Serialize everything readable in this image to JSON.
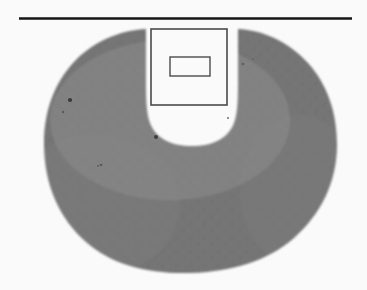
{
  "figure": {
    "kind": "scanned-grayscale-figure",
    "canvas": {
      "width": 367,
      "height": 290
    },
    "background_color": "#fbfafa",
    "caption": "",
    "title": "",
    "labels": [],
    "annotations": []
  },
  "rule": {
    "name": "top-horizontal-rule",
    "x1": 19,
    "y1": 18.5,
    "x2": 352,
    "y2": 18.5,
    "thickness": 2.4,
    "color": "#141414"
  },
  "specimen": {
    "name": "crescent-specimen-region",
    "description": "C-shaped / horseshoe grey halftone region with a rounded U notch opening upward at top centre",
    "fill_color": "#a9a9a9",
    "edge_color": "#8f8f8f",
    "bounds": {
      "left": 44,
      "top": 29,
      "right": 337,
      "bottom": 273
    },
    "notch": {
      "name": "u-notch",
      "left": 146,
      "right": 238,
      "top": 29,
      "bottom": 146,
      "fill_color": "#fbfafa"
    }
  },
  "roi_box": {
    "name": "roi-square",
    "x": 151,
    "y": 29,
    "width": 76,
    "height": 76,
    "stroke_color": "#4a4a4a",
    "stroke_width": 1.6,
    "fill": "none"
  },
  "inner_box": {
    "name": "roi-inner-rectangle",
    "x": 170,
    "y": 57,
    "width": 40,
    "height": 19,
    "stroke_color": "#4a4a4a",
    "stroke_width": 1.4,
    "fill": "none"
  },
  "specks": [
    {
      "name": "scan-speck",
      "cx": 70,
      "cy": 100,
      "r": 2.1,
      "color": "#3a3a3a"
    },
    {
      "name": "scan-speck",
      "cx": 63,
      "cy": 112,
      "r": 1.2,
      "color": "#5c5c5c"
    },
    {
      "name": "scan-speck",
      "cx": 156,
      "cy": 137,
      "r": 2.0,
      "color": "#3f3f3f"
    },
    {
      "name": "scan-speck",
      "cx": 101,
      "cy": 165,
      "r": 1.3,
      "color": "#5a5a5a"
    },
    {
      "name": "scan-speck",
      "cx": 98,
      "cy": 166,
      "r": 1.0,
      "color": "#616161"
    },
    {
      "name": "scan-speck",
      "cx": 243,
      "cy": 64,
      "r": 1.2,
      "color": "#5e5e5e"
    },
    {
      "name": "scan-speck",
      "cx": 253,
      "cy": 59,
      "r": 1.0,
      "color": "#676767"
    },
    {
      "name": "scan-speck",
      "cx": 228,
      "cy": 118,
      "r": 1.0,
      "color": "#6b6b6b"
    }
  ]
}
